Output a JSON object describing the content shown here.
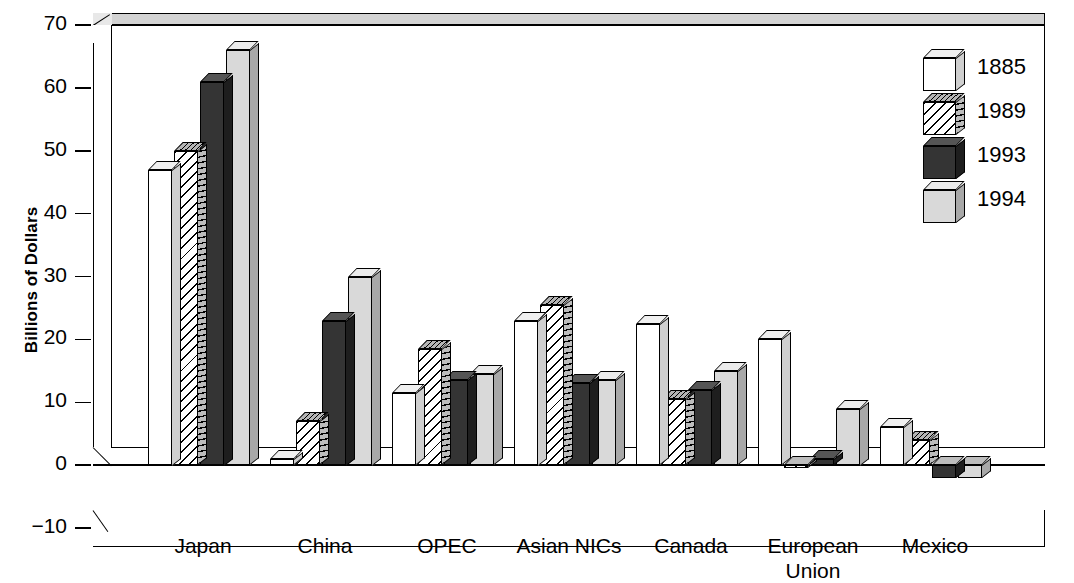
{
  "chart_data": {
    "type": "bar",
    "title": "",
    "xlabel": "",
    "ylabel": "Billions of Dollars",
    "ylim": [
      -10,
      70
    ],
    "yticks": [
      -10,
      0,
      10,
      20,
      30,
      40,
      50,
      60,
      70
    ],
    "ytick_labels": [
      "−10",
      "0",
      "10",
      "20",
      "30",
      "40",
      "50",
      "60",
      "70"
    ],
    "grid": false,
    "legend_position": "top-right",
    "categories": [
      "Japan",
      "China",
      "OPEC",
      "Asian NICs",
      "Canada",
      "European Union",
      "Mexico"
    ],
    "category_lines": [
      [
        "Japan"
      ],
      [
        "China"
      ],
      [
        "OPEC"
      ],
      [
        "Asian NICs"
      ],
      [
        "Canada"
      ],
      [
        "European",
        "Union"
      ],
      [
        "Mexico"
      ]
    ],
    "series": [
      {
        "name": "1885",
        "fill": "white",
        "values": [
          47,
          1,
          11.5,
          23,
          22.5,
          20,
          6
        ]
      },
      {
        "name": "1989",
        "fill": "hatched",
        "values": [
          50,
          7,
          18.5,
          25.5,
          10.5,
          -0.5,
          4
        ]
      },
      {
        "name": "1993",
        "fill": "black",
        "values": [
          61,
          23,
          13.5,
          13,
          12,
          1,
          -2
        ]
      },
      {
        "name": "1994",
        "fill": "gray",
        "values": [
          66,
          30,
          14.5,
          13.5,
          15,
          9,
          -2
        ]
      }
    ]
  },
  "legend": {
    "entries": [
      {
        "label": "1885"
      },
      {
        "label": "1989"
      },
      {
        "label": "1993"
      },
      {
        "label": "1994"
      }
    ]
  },
  "colors": {
    "series_1885": "#ffffff",
    "series_1989": "#ffffff",
    "series_1993": "#343434",
    "series_1994": "#d9d9d9",
    "axis": "#000000",
    "background": "#ffffff"
  }
}
